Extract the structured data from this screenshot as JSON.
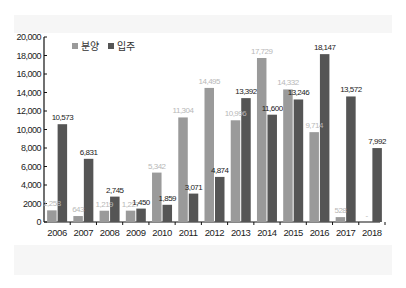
{
  "chart_data": {
    "type": "bar",
    "title": "",
    "xlabel": "",
    "ylabel": "",
    "ylim": [
      0,
      20000
    ],
    "yticks": [
      0,
      2000,
      4000,
      6000,
      8000,
      10000,
      12000,
      14000,
      16000,
      18000,
      20000
    ],
    "ytick_labels": [
      "0",
      "2000",
      "4,000",
      "6,000",
      "8,000",
      "10,000",
      "12,000",
      "14,000",
      "16,000",
      "18,000",
      "20,000"
    ],
    "grid": false,
    "legend_position": "top-left",
    "categories": [
      "2006",
      "2007",
      "2008",
      "2009",
      "2010",
      "2011",
      "2012",
      "2013",
      "2014",
      "2015",
      "2016",
      "2017",
      "2018"
    ],
    "series": [
      {
        "name": "분양",
        "color": "#9a9a9a",
        "values": [
          1258,
          643,
          1219,
          1227,
          5342,
          11304,
          14495,
          10996,
          17729,
          14332,
          9714,
          528,
          0
        ],
        "labels": [
          "1,258",
          "643",
          "1,219",
          "1,227",
          "5,342",
          "11,304",
          "14,495",
          "10,996",
          "17,729",
          "14,332",
          "9,714",
          "528",
          "-"
        ]
      },
      {
        "name": "입주",
        "color": "#555555",
        "values": [
          10573,
          6831,
          2745,
          1450,
          1859,
          3071,
          4874,
          13392,
          11600,
          13246,
          18147,
          13572,
          7992
        ],
        "labels": [
          "10,573",
          "6,831",
          "2,745",
          "1,450",
          "1,859",
          "3,071",
          "4,874",
          "13,392",
          "11,600",
          "13,246",
          "18,147",
          "13,572",
          "7,992"
        ]
      }
    ]
  }
}
